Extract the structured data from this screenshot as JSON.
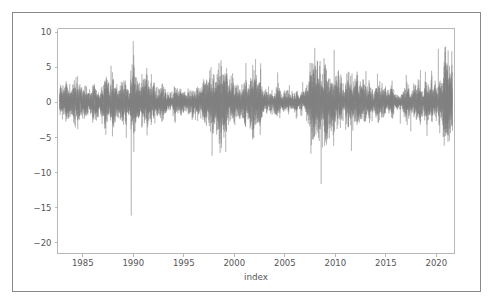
{
  "figure": {
    "background_color": "#ffffff",
    "border_color": "#8a8a8a",
    "axes_background_color": "#ffffff"
  },
  "chart_data": {
    "type": "line",
    "title": "",
    "subtitle": "",
    "xlabel": "index",
    "ylabel": "",
    "xlim": [
      1982.5,
      2021.8
    ],
    "ylim": [
      -21.5,
      10.5
    ],
    "grid": false,
    "legend": null,
    "legend_position": "none",
    "line_color": "#808080",
    "line_width": 0.35,
    "x_ticks": [
      1985,
      1990,
      1995,
      2000,
      2005,
      2010,
      2015,
      2020
    ],
    "x_tick_labels": [
      "1985",
      "1990",
      "1995",
      "2000",
      "2005",
      "2010",
      "2015",
      "2020"
    ],
    "y_ticks": [
      10,
      5,
      0,
      -5,
      -10,
      -15,
      -20
    ],
    "y_tick_labels": [
      "10",
      "5",
      "0",
      "−5",
      "−10",
      "−15",
      "−20"
    ],
    "series": [
      {
        "name": "daily returns",
        "description": "Daily percent returns, approximately zero-mean white noise with volatility clustering and sharp negative outliers.",
        "n_points": 9900,
        "x_start": 1982.7,
        "x_end": 2021.6,
        "mean": 0.04,
        "baseline_std": 1.05,
        "max_value": 8.7,
        "min_value": -20.5,
        "notable_extremes": [
          {
            "x": 1987.8,
            "y": -20.5,
            "label": "largest drawdown"
          },
          {
            "x": 1989.8,
            "y": -16.1,
            "label": "secondary drawdown"
          },
          {
            "x": 1987.8,
            "y": 5.2,
            "label": "rebound"
          },
          {
            "x": 1990.0,
            "y": 8.7,
            "label": "peak gain"
          },
          {
            "x": 2008.6,
            "y": -11.6,
            "label": "financial crisis"
          },
          {
            "x": 2020.2,
            "y": -13.0,
            "label": "pandemic crash"
          },
          {
            "x": 2020.2,
            "y": 7.6,
            "label": "pandemic rebound"
          },
          {
            "x": 1997.8,
            "y": -7.6,
            "label": "asia crisis"
          },
          {
            "x": 2011.6,
            "y": -6.9,
            "label": "debt downgrade"
          }
        ],
        "volatility_regimes": [
          {
            "x_start": 1982.7,
            "x_end": 1987.5,
            "std": 1.0
          },
          {
            "x_start": 1987.5,
            "x_end": 1991.0,
            "std": 1.55
          },
          {
            "x_start": 1991.0,
            "x_end": 1997.0,
            "std": 0.82
          },
          {
            "x_start": 1997.0,
            "x_end": 2003.5,
            "std": 1.35
          },
          {
            "x_start": 2003.5,
            "x_end": 2007.5,
            "std": 0.8
          },
          {
            "x_start": 2007.5,
            "x_end": 2010.0,
            "std": 1.7
          },
          {
            "x_start": 2010.0,
            "x_end": 2012.5,
            "std": 1.25
          },
          {
            "x_start": 2012.5,
            "x_end": 2018.0,
            "std": 0.85
          },
          {
            "x_start": 2018.0,
            "x_end": 2019.5,
            "std": 1.15
          },
          {
            "x_start": 2019.5,
            "x_end": 2021.6,
            "std": 1.6
          }
        ]
      }
    ]
  }
}
